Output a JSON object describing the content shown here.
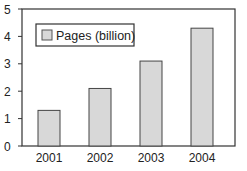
{
  "chart_data": {
    "type": "bar",
    "title": "",
    "xlabel": "",
    "ylabel": "",
    "categories": [
      "2001",
      "2002",
      "2003",
      "2004"
    ],
    "series": [
      {
        "name": "Pages (billion)",
        "values": [
          1.3,
          2.1,
          3.1,
          4.3
        ]
      }
    ],
    "ylim": [
      0,
      5
    ],
    "yticks": [
      "0",
      "1",
      "2",
      "3",
      "4",
      "5"
    ],
    "grid": false,
    "legend_position": "upper-left-inside"
  },
  "legend": {
    "label": "Pages (billion)"
  },
  "colors": {
    "bar_fill": "#d8d8d8",
    "bar_stroke": "#444444",
    "axis": "#333333"
  }
}
